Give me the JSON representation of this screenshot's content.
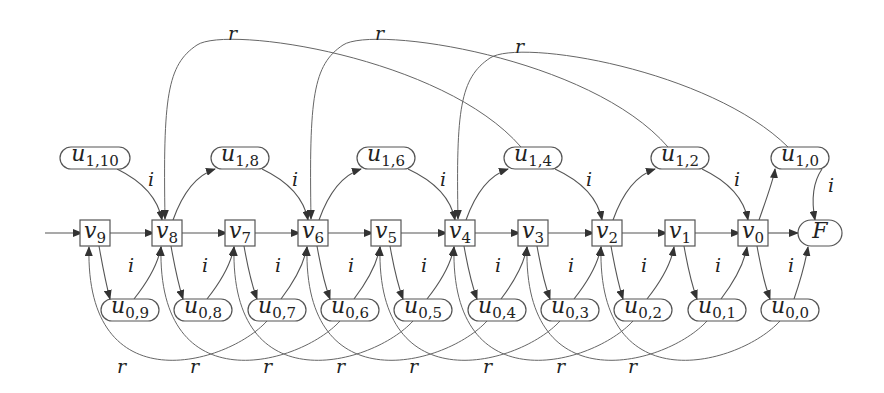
{
  "diagram": {
    "type": "state-graph",
    "main_row": [
      {
        "id": "v9",
        "base": "v",
        "sub": "9",
        "shape": "box",
        "x": 95
      },
      {
        "id": "v8",
        "base": "v",
        "sub": "8",
        "shape": "box",
        "x": 167
      },
      {
        "id": "v7",
        "base": "v",
        "sub": "7",
        "shape": "box",
        "x": 240
      },
      {
        "id": "v6",
        "base": "v",
        "sub": "6",
        "shape": "box",
        "x": 313
      },
      {
        "id": "v5",
        "base": "v",
        "sub": "5",
        "shape": "box",
        "x": 386
      },
      {
        "id": "v4",
        "base": "v",
        "sub": "4",
        "shape": "box",
        "x": 460
      },
      {
        "id": "v3",
        "base": "v",
        "sub": "3",
        "shape": "box",
        "x": 533
      },
      {
        "id": "v2",
        "base": "v",
        "sub": "2",
        "shape": "box",
        "x": 607
      },
      {
        "id": "v1",
        "base": "v",
        "sub": "1",
        "shape": "box",
        "x": 680
      },
      {
        "id": "v0",
        "base": "v",
        "sub": "0",
        "shape": "box",
        "x": 753
      },
      {
        "id": "F",
        "base": "F",
        "sub": "",
        "shape": "pill",
        "x": 820
      }
    ],
    "top_row": [
      {
        "id": "u1_10",
        "base": "u",
        "sub": "1,10",
        "x": 95
      },
      {
        "id": "u1_8",
        "base": "u",
        "sub": "1,8",
        "x": 240
      },
      {
        "id": "u1_6",
        "base": "u",
        "sub": "1,6",
        "x": 386
      },
      {
        "id": "u1_4",
        "base": "u",
        "sub": "1,4",
        "x": 533
      },
      {
        "id": "u1_2",
        "base": "u",
        "sub": "1,2",
        "x": 680
      },
      {
        "id": "u1_0",
        "base": "u",
        "sub": "1,0",
        "x": 800
      }
    ],
    "bottom_row": [
      {
        "id": "u0_9",
        "base": "u",
        "sub": "0,9",
        "x": 130
      },
      {
        "id": "u0_8",
        "base": "u",
        "sub": "0,8",
        "x": 203
      },
      {
        "id": "u0_7",
        "base": "u",
        "sub": "0,7",
        "x": 277
      },
      {
        "id": "u0_6",
        "base": "u",
        "sub": "0,6",
        "x": 350
      },
      {
        "id": "u0_5",
        "base": "u",
        "sub": "0,5",
        "x": 423
      },
      {
        "id": "u0_4",
        "base": "u",
        "sub": "0,4",
        "x": 497
      },
      {
        "id": "u0_3",
        "base": "u",
        "sub": "0,3",
        "x": 570
      },
      {
        "id": "u0_2",
        "base": "u",
        "sub": "0,2",
        "x": 643
      },
      {
        "id": "u0_1",
        "base": "u",
        "sub": "0,1",
        "x": 717
      },
      {
        "id": "u0_0",
        "base": "u",
        "sub": "0,0",
        "x": 790
      }
    ],
    "edge_labels": {
      "input": "i",
      "reset": "r"
    },
    "top_r_labels": [
      {
        "text": "r",
        "x": 228,
        "y": 40
      },
      {
        "text": "r",
        "x": 375,
        "y": 40
      },
      {
        "text": "r",
        "x": 515,
        "y": 53
      }
    ],
    "bottom_r_labels": [
      {
        "text": "r",
        "x": 117
      },
      {
        "text": "r",
        "x": 190
      },
      {
        "text": "r",
        "x": 263
      },
      {
        "text": "r",
        "x": 336
      },
      {
        "text": "r",
        "x": 409
      },
      {
        "text": "r",
        "x": 483
      },
      {
        "text": "r",
        "x": 556
      },
      {
        "text": "r",
        "x": 628
      }
    ],
    "top_i_labels": [
      {
        "text": "i",
        "x": 148,
        "y": 186
      },
      {
        "text": "i",
        "x": 292,
        "y": 186
      },
      {
        "text": "i",
        "x": 440,
        "y": 186
      },
      {
        "text": "i",
        "x": 586,
        "y": 186
      },
      {
        "text": "i",
        "x": 734,
        "y": 186
      },
      {
        "text": "i",
        "x": 828,
        "y": 192
      }
    ],
    "bottom_i_labels": [
      {
        "text": "i",
        "x": 128
      },
      {
        "text": "i",
        "x": 202
      },
      {
        "text": "i",
        "x": 275
      },
      {
        "text": "i",
        "x": 348
      },
      {
        "text": "i",
        "x": 421
      },
      {
        "text": "i",
        "x": 495
      },
      {
        "text": "i",
        "x": 568
      },
      {
        "text": "i",
        "x": 641
      },
      {
        "text": "i",
        "x": 715
      },
      {
        "text": "i",
        "x": 788
      }
    ]
  }
}
